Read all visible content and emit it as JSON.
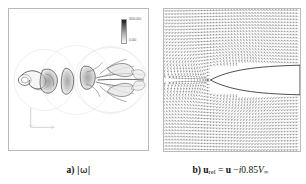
{
  "figure": {
    "panels": [
      {
        "id": "a",
        "type": "contour",
        "caption_label": "a)",
        "caption_quantity": "|ω|",
        "colorbar": {
          "max_label": "3000.000",
          "min_label": "0.000",
          "orientation": "vertical",
          "colormap": "grayscale-dark-to-light"
        }
      },
      {
        "id": "b",
        "type": "vector-field",
        "caption_label": "b)",
        "caption_lhs": "u",
        "caption_lhs_sub": "rel",
        "caption_eq": "=",
        "caption_rhs_vec": "u",
        "caption_minus": "−",
        "caption_i": "i",
        "caption_coeff": "0.85",
        "caption_V": "V",
        "caption_V_sub": "∞"
      }
    ]
  },
  "chart_data": [
    {
      "type": "heatmap",
      "title": "a) |ω|",
      "subtitle": "",
      "xlabel": "",
      "ylabel": "",
      "legend_position": "top-right",
      "grid": false,
      "colorbar_ticks": [
        "3000.000",
        "0.000"
      ],
      "colorbar_range": [
        0,
        3000
      ],
      "field_name": "vorticity magnitude",
      "field_symbol": "|ω|",
      "description": "Vortex wake: shed vortex structures arranged along the horizontal centerline with faint circular domain outlines and a trailing filament wake toward the right",
      "vortex_centers_x": [
        0.12,
        0.3,
        0.45,
        0.62,
        0.78
      ],
      "vortex_centers_y": [
        0.5,
        0.5,
        0.5,
        0.5,
        0.5
      ],
      "axis_indicator": "lower-left L-shaped axes marker"
    },
    {
      "type": "scatter",
      "title": "b) u_rel = u − i0.85V∞",
      "subtitle": "",
      "xlabel": "",
      "ylabel": "",
      "legend_position": "none",
      "grid": false,
      "field_name": "relative velocity vectors",
      "description": "Quiver plot of the relative velocity field around a thin elliptic airfoil whose pointed leading edge is at mid-left and whose body extends off the right edge",
      "body_shape": "thin ellipse / airfoil",
      "body_nose_x": 0.34,
      "body_nose_y": 0.5,
      "arrow_rows": 46,
      "arrow_cols": 46
    }
  ]
}
